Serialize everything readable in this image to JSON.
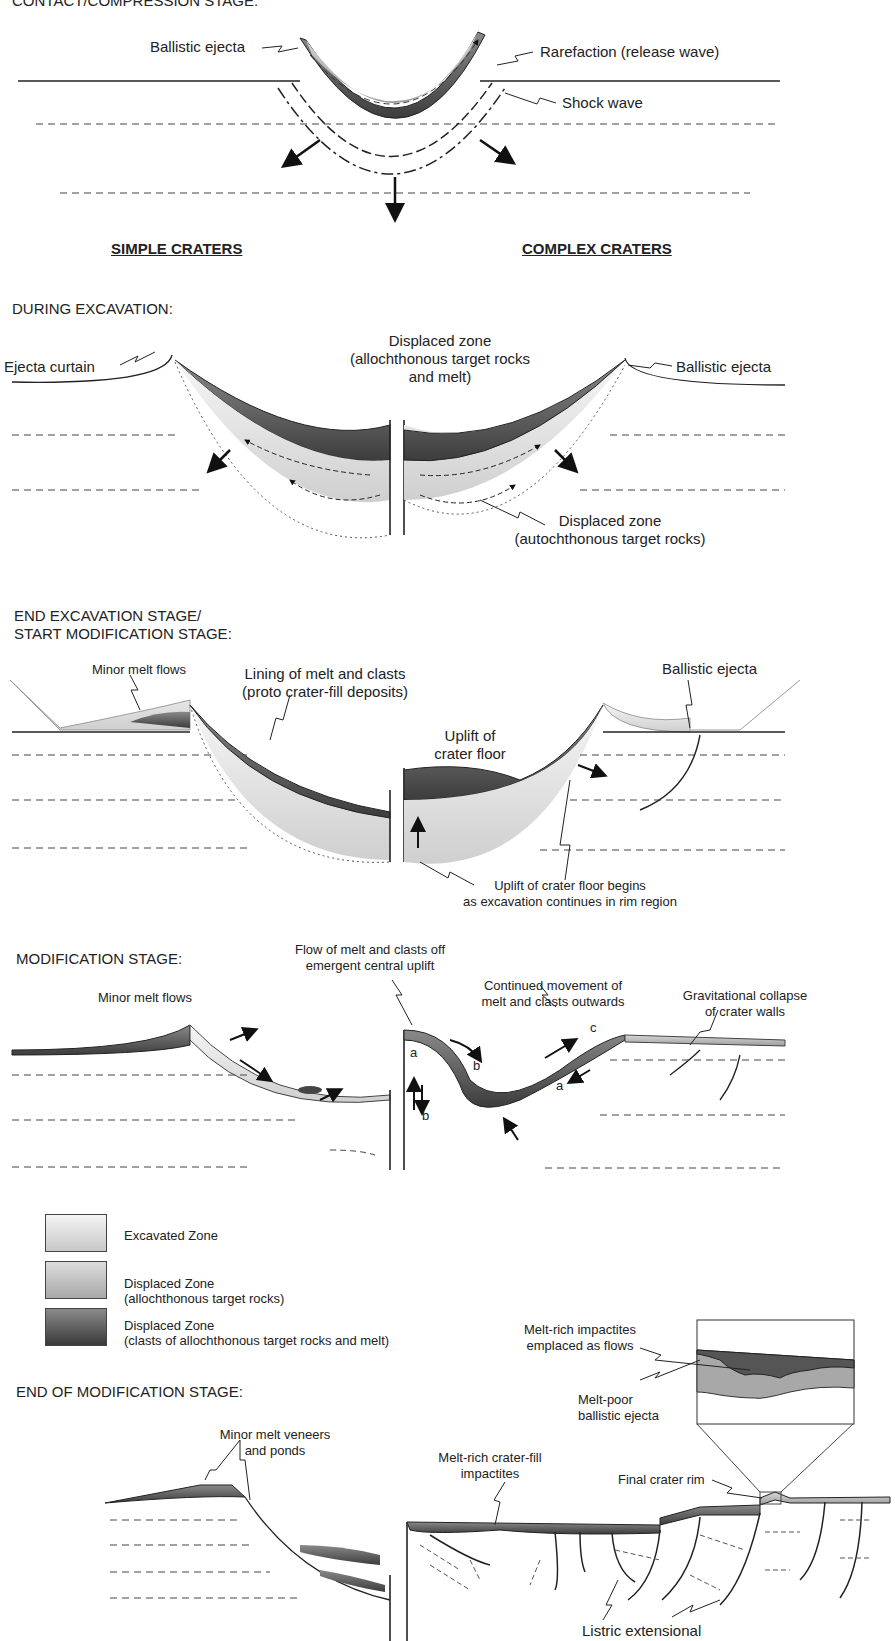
{
  "stages": {
    "contact": "CONTACT/COMPRESSION STAGE:",
    "excavation": "DURING EXCAVATION:",
    "end_excavation_1": "END EXCAVATION STAGE/",
    "end_excavation_2": "START MODIFICATION STAGE:",
    "modification": "MODIFICATION STAGE:",
    "end_modification": "END OF MODIFICATION STAGE:"
  },
  "headers": {
    "simple": "SIMPLE CRATERS",
    "complex": "COMPLEX CRATERS"
  },
  "labels": {
    "contact_ballistic": "Ballistic ejecta",
    "rarefaction": "Rarefaction (release wave)",
    "shock_wave": "Shock wave",
    "ejecta_curtain": "Ejecta curtain",
    "displaced_allo_1": "Displaced zone",
    "displaced_allo_2": "(allochthonous target rocks",
    "displaced_allo_3": "and melt)",
    "exc_ballistic": "Ballistic ejecta",
    "displaced_auto_1": "Displaced zone",
    "displaced_auto_2": "(autochthonous target rocks)",
    "minor_melt_flows_1": "Minor melt flows",
    "lining_1": "Lining of melt and clasts",
    "lining_2": "(proto crater-fill deposits)",
    "end_ballistic": "Ballistic ejecta",
    "uplift_floor_1": "Uplift of",
    "uplift_floor_2": "crater floor",
    "uplift_begins_1": "Uplift of crater floor begins",
    "uplift_begins_2": "as excavation continues in rim region",
    "flow_melt_1": "Flow of melt and clasts off",
    "flow_melt_2": "emergent central uplift",
    "minor_melt_flows_2": "Minor melt flows",
    "continued_1": "Continued movement of",
    "continued_2": "melt and clasts outwards",
    "grav_1": "Gravitational collapse",
    "grav_2": "of crater walls",
    "letter_a1": "a",
    "letter_b1": "b",
    "letter_b2": "b",
    "letter_c": "c",
    "letter_a2": "a",
    "melt_rich_flows_1": "Melt-rich impactites",
    "melt_rich_flows_2": "emplaced as flows",
    "melt_poor_1": "Melt-poor",
    "melt_poor_2": "ballistic ejecta",
    "veneers_1": "Minor melt veneers",
    "veneers_2": "and ponds",
    "crater_fill_1": "Melt-rich crater-fill",
    "crater_fill_2": "impactites",
    "final_rim": "Final crater rim",
    "listric": "Listric extensional"
  },
  "legend": [
    {
      "title": "Excavated Zone",
      "sub": "",
      "color_top": "#f4f4f4",
      "color_bot": "#c8c8c8"
    },
    {
      "title": "Displaced Zone",
      "sub": "(allochthonous target rocks)",
      "color_top": "#dcdcdc",
      "color_bot": "#a8a8a8"
    },
    {
      "title": "Displaced Zone",
      "sub": "(clasts of allochthonous target rocks and melt)",
      "color_top": "#8a8a8a",
      "color_bot": "#3a3a3a"
    }
  ],
  "colors": {
    "line": "#222222",
    "dashed": "#333333",
    "light_fill": "#e6e6e6",
    "mid_fill": "#b4b4b4",
    "dark_fill": "#555555"
  }
}
